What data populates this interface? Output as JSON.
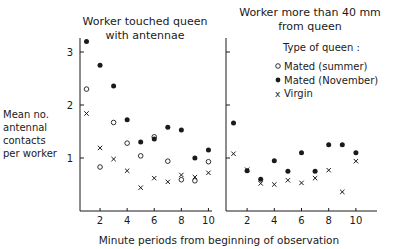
{
  "chart_data": [
    {
      "type": "scatter",
      "title": "Worker touched queen with antennae",
      "title_lines": [
        "Worker touched queen",
        "with antennae"
      ],
      "xlabel": "Minute periods from beginning of observation",
      "ylabel": "Mean no. antennal contacts per worker",
      "ylabel_lines": [
        "Mean no.",
        "antennal",
        "contacts",
        "per worker"
      ],
      "xticks": [
        2,
        4,
        6,
        8,
        10
      ],
      "yticks": [
        1,
        2,
        3
      ],
      "xlim": [
        0.5,
        10.5
      ],
      "ylim": [
        0,
        3.3
      ],
      "grid": false,
      "series": [
        {
          "name": "Mated (summer)",
          "marker": "open-circle",
          "x": [
            1,
            2,
            3,
            4,
            5,
            6,
            7,
            8,
            9,
            10
          ],
          "values": [
            2.3,
            0.83,
            1.67,
            1.28,
            1.04,
            1.4,
            0.94,
            0.59,
            0.57,
            0.93
          ]
        },
        {
          "name": "Mated (November)",
          "marker": "filled-circle",
          "x": [
            1,
            2,
            3,
            4,
            5,
            6,
            7,
            8,
            9,
            10
          ],
          "values": [
            3.2,
            2.75,
            2.36,
            1.72,
            1.3,
            1.36,
            1.58,
            1.53,
            1.0,
            1.15
          ]
        },
        {
          "name": "Virgin",
          "marker": "x",
          "x": [
            1,
            2,
            3,
            4,
            5,
            6,
            7,
            8,
            9,
            10
          ],
          "values": [
            1.84,
            1.19,
            0.98,
            0.76,
            0.44,
            0.62,
            0.55,
            0.68,
            0.64,
            0.72
          ]
        }
      ]
    },
    {
      "type": "scatter",
      "title": "Worker more than 40 mm from queen",
      "title_lines": [
        "Worker more than 40 mm",
        "from queen"
      ],
      "xlabel": "Minute periods from beginning of observation",
      "ylabel": "Mean no. antennal contacts per worker",
      "xticks": [
        2,
        4,
        6,
        8,
        10
      ],
      "yticks": [
        1,
        2,
        3
      ],
      "xlim": [
        0.5,
        11.5
      ],
      "ylim": [
        0,
        3.3
      ],
      "grid": false,
      "legend": {
        "title": "Type of queen:",
        "entries": [
          {
            "marker": "open-circle",
            "label": "Mated (summer)"
          },
          {
            "marker": "filled-circle",
            "label": "Mated (November)"
          },
          {
            "marker": "x",
            "label": "Virgin"
          }
        ],
        "position": "upper right"
      },
      "series": [
        {
          "name": "Mated (November)",
          "marker": "filled-circle",
          "x": [
            1,
            2,
            3,
            4,
            5,
            6,
            7,
            8,
            9,
            10
          ],
          "values": [
            1.66,
            0.76,
            0.6,
            0.95,
            0.75,
            1.1,
            0.75,
            1.25,
            1.25,
            1.1
          ]
        },
        {
          "name": "Virgin",
          "marker": "x",
          "x": [
            1,
            2,
            3,
            4,
            5,
            6,
            7,
            8,
            9,
            10
          ],
          "values": [
            1.08,
            0.78,
            0.52,
            0.5,
            0.58,
            0.53,
            0.62,
            0.77,
            0.36,
            0.94
          ]
        }
      ]
    }
  ],
  "labels": {
    "left_title_1": "Worker touched queen",
    "left_title_2": "with antennae",
    "right_title_1": "Worker more than 40 mm",
    "right_title_2": "from queen",
    "ylabel_1": "Mean no.",
    "ylabel_2": "antennal",
    "ylabel_3": "contacts",
    "ylabel_4": "per worker",
    "xlabel": "Minute periods from beginning of observation",
    "legend_title": "Type of queen :",
    "legend_summer": "Mated (summer)",
    "legend_november": "Mated (November)",
    "legend_virgin": "Virgin"
  }
}
